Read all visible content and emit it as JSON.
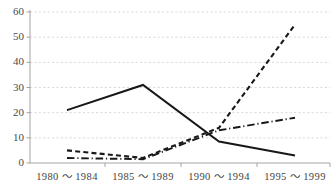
{
  "chart_data": {
    "type": "line",
    "title": "",
    "xlabel": "",
    "ylabel": "",
    "categories": [
      "1980 ～ 1984",
      "1985 ～ 1989",
      "1990 ～ 1994",
      "1995 ～ 1999"
    ],
    "ylim": [
      0,
      60
    ],
    "yticks": [
      0,
      10,
      20,
      30,
      40,
      50,
      60
    ],
    "ytick_labels": [
      "0",
      "10",
      "20",
      "30",
      "40",
      "50",
      "60"
    ],
    "grid": true,
    "grid_axis": "y",
    "legend": false,
    "legend_position": "none",
    "series": [
      {
        "name": "series-1",
        "style": "solid",
        "color": "#181818",
        "values": [
          21,
          31,
          8.5,
          3
        ]
      },
      {
        "name": "series-2",
        "style": "dashed",
        "color": "#181818",
        "values": [
          5,
          2,
          14,
          55
        ]
      },
      {
        "name": "series-3",
        "style": "dash-dot",
        "color": "#181818",
        "values": [
          2,
          1.5,
          13,
          18
        ]
      }
    ]
  },
  "plot": {
    "left": 30,
    "right": 330,
    "top": 12,
    "bottom": 163,
    "x_positions": [
      67,
      143,
      219,
      295
    ]
  },
  "colors": {
    "grid": "#c9c9d6",
    "axis": "#9a9a9a",
    "ink": "#181818",
    "tick_text": "#4a4a4a",
    "background": "#ffffff"
  }
}
